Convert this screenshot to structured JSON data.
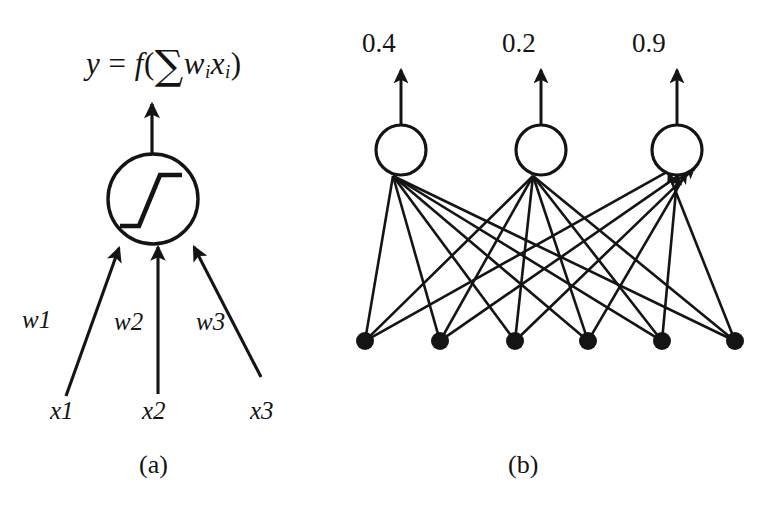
{
  "figure": {
    "background": "#ffffff",
    "ink": "#141414",
    "panels": [
      {
        "id": "a",
        "caption": "(a)",
        "title": "single artificial neuron",
        "formula": {
          "parts": {
            "y": "y",
            "equals": " = ",
            "f": "f",
            "open_paren": "(",
            "sigma": "∑",
            "w": "w",
            "w_sub": "i",
            "x": "x",
            "x_sub": "i",
            "close_paren": ")"
          },
          "plain": "y = f( ∑ wᵢ xᵢ )"
        },
        "neuron": {
          "cx": 153,
          "cy": 199,
          "r": 45,
          "activation_icon": "step-function-icon"
        },
        "weights": [
          {
            "label": "w1",
            "x": 22,
            "y": 307
          },
          {
            "label": "w2",
            "x": 114,
            "y": 309
          },
          {
            "label": "w3",
            "x": 196,
            "y": 309
          }
        ],
        "inputs": [
          {
            "label": "x1",
            "x": 50,
            "y": 398
          },
          {
            "label": "x2",
            "x": 142,
            "y": 398
          },
          {
            "label": "x3",
            "x": 250,
            "y": 398
          }
        ]
      },
      {
        "id": "b",
        "caption": "(b)",
        "title": "fully connected layer",
        "outputs": [
          {
            "value": "0.4",
            "cx": 401,
            "cy": 150,
            "r": 25,
            "label_x": 362,
            "label_y": 30
          },
          {
            "value": "0.2",
            "cx": 541,
            "cy": 150,
            "r": 25,
            "label_x": 502,
            "label_y": 30
          },
          {
            "value": "0.9",
            "cx": 677,
            "cy": 150,
            "r": 25,
            "label_x": 632,
            "label_y": 30
          }
        ],
        "input_nodes": [
          {
            "cx": 365,
            "cy": 341,
            "r": 9
          },
          {
            "cx": 440,
            "cy": 341,
            "r": 9
          },
          {
            "cx": 515,
            "cy": 341,
            "r": 9
          },
          {
            "cx": 588,
            "cy": 341,
            "r": 9
          },
          {
            "cx": 662,
            "cy": 341,
            "r": 9
          },
          {
            "cx": 735,
            "cy": 341,
            "r": 9
          }
        ],
        "connections": {
          "description": "fully connected: every input node links to every output neuron",
          "count": 18
        }
      }
    ]
  }
}
